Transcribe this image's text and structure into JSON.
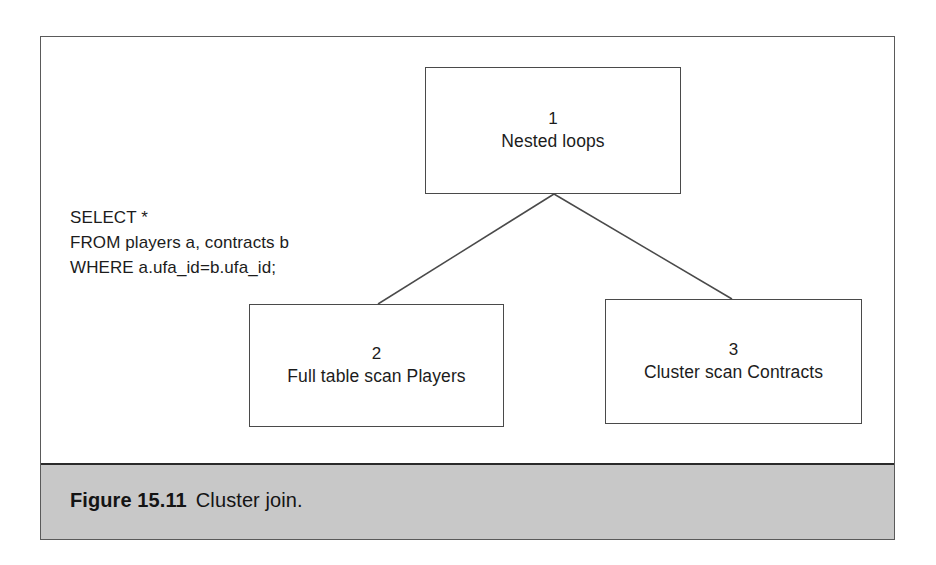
{
  "figure": {
    "caption_number": "Figure 15.11",
    "caption_title": "Cluster join.",
    "frame_border_color": "#5a5a5a",
    "caption_band_color": "#c8c8c8",
    "box_border_color": "#4a4a4a",
    "connector_color": "#4a4a4a",
    "text_color": "#1c1c1c"
  },
  "query": {
    "line1": "SELECT *",
    "line2": "FROM players a, contracts b",
    "line3": "WHERE a.ufa_id=b.ufa_id;"
  },
  "nodes": [
    {
      "id": "1",
      "label": "Nested loops"
    },
    {
      "id": "2",
      "label": "Full table scan Players"
    },
    {
      "id": "3",
      "label": "Cluster scan Contracts"
    }
  ],
  "connectors": [
    {
      "from": "1",
      "to": "2"
    },
    {
      "from": "1",
      "to": "3"
    }
  ]
}
